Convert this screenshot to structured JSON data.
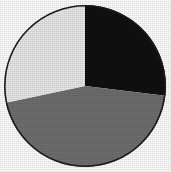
{
  "figure": {
    "background_color": "#ffffff",
    "outline_color": "#1c1c1c",
    "outline_width": 1.6,
    "center_x": 85,
    "center_y": 86,
    "radius": 81
  },
  "chart_data": {
    "type": "pie",
    "title": "",
    "subtitle": "",
    "xlabel": "",
    "ylabel": "",
    "grid": false,
    "legend_position": "none",
    "start_angle_deg": 0,
    "direction": "clockwise",
    "labels": [
      "Slice 1",
      "Slice 2",
      "Slice 3"
    ],
    "categories": [
      "Black",
      "Medium Gray",
      "Light Gray"
    ],
    "values": [
      27,
      45,
      28
    ],
    "units": "percent",
    "colors": [
      "#101010",
      "#6f6f6f",
      "#e9e9e9"
    ],
    "slices": [
      {
        "name": "Black",
        "color": "#101010",
        "value": 27,
        "start_angle_deg": 0,
        "end_angle_deg": 97,
        "sweep_deg": 97
      },
      {
        "name": "Medium Gray",
        "color": "#6f6f6f",
        "value": 45,
        "start_angle_deg": 97,
        "end_angle_deg": 258,
        "sweep_deg": 161
      },
      {
        "name": "Light Gray",
        "color": "#e9e9e9",
        "value": 28,
        "start_angle_deg": 258,
        "end_angle_deg": 360,
        "sweep_deg": 102
      }
    ],
    "annotations": []
  }
}
